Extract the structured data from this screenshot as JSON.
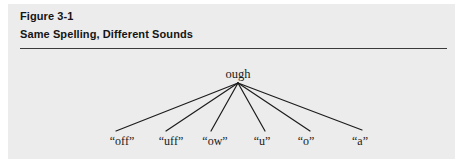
{
  "figure": {
    "number": "Figure 3-1",
    "title": "Same Spelling, Different Sounds",
    "panel_background": "#ececec",
    "rule_color": "#3a3a3a",
    "text_color": "#141414"
  },
  "diagram": {
    "type": "tree",
    "root": {
      "label": "ough",
      "x": 238,
      "y": 74
    },
    "apex": {
      "x": 238,
      "y": 83
    },
    "line_color": "#1c1c1c",
    "line_width": 1.2,
    "leaves": [
      {
        "label": "“off”",
        "x": 122,
        "y": 141,
        "line_end_x": 116,
        "line_end_y": 131
      },
      {
        "label": "“uff”",
        "x": 171,
        "y": 141,
        "line_end_x": 166,
        "line_end_y": 131
      },
      {
        "label": "“ow”",
        "x": 215,
        "y": 141,
        "line_end_x": 211,
        "line_end_y": 131
      },
      {
        "label": "“u”",
        "x": 262,
        "y": 141,
        "line_end_x": 265,
        "line_end_y": 131
      },
      {
        "label": "“o”",
        "x": 306,
        "y": 141,
        "line_end_x": 310,
        "line_end_y": 131
      },
      {
        "label": "“a”",
        "x": 360,
        "y": 141,
        "line_end_x": 362,
        "line_end_y": 130
      }
    ]
  }
}
